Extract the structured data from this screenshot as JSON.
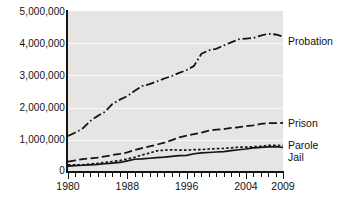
{
  "chart_data": {
    "type": "line",
    "title": "",
    "xlabel": "",
    "ylabel": "",
    "xlim": [
      1980,
      2009
    ],
    "ylim": [
      0,
      5000000
    ],
    "grid": true,
    "legend_position": "right-inline-labels",
    "y_ticks": [
      "0",
      "1,000,000",
      "2,000,000",
      "3,000,000",
      "4,000,000",
      "5,000,000"
    ],
    "y_tick_values": [
      0,
      1000000,
      2000000,
      3000000,
      4000000,
      5000000
    ],
    "x_ticks": [
      "1980",
      "1988",
      "1996",
      "2004",
      "2009"
    ],
    "x_tick_values": [
      1980,
      1988,
      1996,
      2004,
      2009
    ],
    "x_minor_tick_interval": 1,
    "x": [
      1980,
      1981,
      1982,
      1983,
      1984,
      1985,
      1986,
      1987,
      1988,
      1989,
      1990,
      1991,
      1992,
      1993,
      1994,
      1995,
      1996,
      1997,
      1998,
      1999,
      2000,
      2001,
      2002,
      2003,
      2004,
      2005,
      2006,
      2007,
      2008,
      2009
    ],
    "series": [
      {
        "name": "Probation",
        "style": "dash-dot",
        "color": "#141414",
        "values": [
          1118097,
          1225934,
          1357264,
          1582947,
          1740948,
          1870132,
          2114621,
          2247158,
          2356483,
          2522125,
          2670234,
          2728472,
          2811611,
          2903061,
          2981022,
          3077861,
          3164996,
          3296513,
          3670441,
          3779922,
          3826209,
          3931731,
          4024067,
          4120012,
          4143792,
          4162536,
          4236800,
          4293163,
          4270917,
          4203967
        ]
      },
      {
        "name": "Prison",
        "style": "long-dash",
        "color": "#141414",
        "values": [
          319598,
          360029,
          402914,
          423898,
          448264,
          487593,
          526436,
          562814,
          607766,
          683367,
          743382,
          792535,
          850566,
          909381,
          990147,
          1078542,
          1127528,
          1176564,
          1224469,
          1287172,
          1316333,
          1330007,
          1367547,
          1390279,
          1421345,
          1448344,
          1492973,
          1517867,
          1518559,
          1524513
        ]
      },
      {
        "name": "Parole",
        "style": "dotted",
        "color": "#141414",
        "values": [
          220438,
          225539,
          224604,
          246440,
          266992,
          300203,
          325638,
          355505,
          407977,
          456803,
          531407,
          590442,
          658601,
          676100,
          690371,
          679421,
          679733,
          694787,
          696385,
          714457,
          723898,
          732333,
          750934,
          769925,
          771852,
          784408,
          798202,
          824365,
          828169,
          819308
        ]
      },
      {
        "name": "Jail",
        "style": "solid",
        "color": "#141414",
        "values": [
          183988,
          196785,
          209582,
          223551,
          234500,
          256615,
          274444,
          295873,
          343569,
          395553,
          405320,
          426479,
          444584,
          459804,
          486474,
          507044,
          518492,
          567079,
          592462,
          605943,
          621149,
          631240,
          665475,
          691301,
          713990,
          747529,
          765819,
          780174,
          785533,
          760400
        ]
      }
    ]
  },
  "axis": {
    "y_label_0": "0",
    "y_label_1m": "1,000,000",
    "y_label_2m": "2,000,000",
    "y_label_3m": "3,000,000",
    "y_label_4m": "4,000,000",
    "y_label_5m": "5,000,000",
    "x_label_1980": "1980",
    "x_label_1988": "1988",
    "x_label_1996": "1996",
    "x_label_2004": "2004",
    "x_label_2009": "2009"
  },
  "labels": {
    "probation": "Probation",
    "prison": "Prison",
    "parole": "Parole",
    "jail": "Jail"
  }
}
